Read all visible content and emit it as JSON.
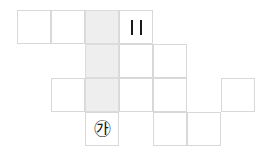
{
  "figure": {
    "background_color": "#ffffff",
    "grid_line_color": "#d8d8d8",
    "shaded_cell_color": "#eeeeee",
    "mark_color": "#1a1a1a",
    "cell_size_px": 34,
    "origin_x_px": 17,
    "origin_y_px": 10,
    "columns": 7,
    "rows": 4
  },
  "cells": [
    {
      "id": "cell-c0-r0",
      "col": 0,
      "row": 0,
      "shaded": false,
      "label": ""
    },
    {
      "id": "cell-c1-r0",
      "col": 1,
      "row": 0,
      "shaded": false,
      "label": ""
    },
    {
      "id": "cell-c2-r0",
      "col": 2,
      "row": 0,
      "shaded": true,
      "label": ""
    },
    {
      "id": "cell-c3-r0",
      "col": 3,
      "row": 0,
      "shaded": false,
      "label": ""
    },
    {
      "id": "cell-c2-r1",
      "col": 2,
      "row": 1,
      "shaded": true,
      "label": ""
    },
    {
      "id": "cell-c3-r1",
      "col": 3,
      "row": 1,
      "shaded": false,
      "label": ""
    },
    {
      "id": "cell-c4-r1",
      "col": 4,
      "row": 1,
      "shaded": false,
      "label": ""
    },
    {
      "id": "cell-c1-r2",
      "col": 1,
      "row": 2,
      "shaded": false,
      "label": ""
    },
    {
      "id": "cell-c2-r2",
      "col": 2,
      "row": 2,
      "shaded": true,
      "label": ""
    },
    {
      "id": "cell-c3-r2",
      "col": 3,
      "row": 2,
      "shaded": false,
      "label": ""
    },
    {
      "id": "cell-c4-r2",
      "col": 4,
      "row": 2,
      "shaded": false,
      "label": ""
    },
    {
      "id": "cell-c6-r2",
      "col": 6,
      "row": 2,
      "shaded": false,
      "label": ""
    },
    {
      "id": "cell-c2-r3",
      "col": 2,
      "row": 3,
      "shaded": false,
      "label": "㉮"
    },
    {
      "id": "cell-c4-r3",
      "col": 4,
      "row": 3,
      "shaded": false,
      "label": ""
    },
    {
      "id": "cell-c5-r3",
      "col": 5,
      "row": 3,
      "shaded": false,
      "label": ""
    }
  ],
  "marks": {
    "tick_marks": {
      "name": "double-tick-mark",
      "col": 3,
      "row": 0,
      "count": 2,
      "symbol": "|"
    },
    "circled_label": {
      "name": "circled-ga-label",
      "col": 2,
      "row": 3,
      "text": "㉮"
    }
  }
}
